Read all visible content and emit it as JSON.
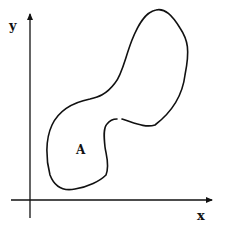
{
  "diagram": {
    "x_axis_label": "x",
    "y_axis_label": "y",
    "region_label": "A",
    "colors": {
      "stroke": "#111111",
      "background": "#ffffff"
    }
  }
}
